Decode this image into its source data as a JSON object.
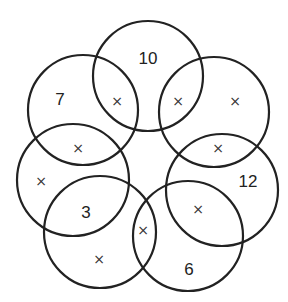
{
  "diagram": {
    "type": "ring-of-overlapping-circles",
    "stroke_color": "#222222",
    "background": "#ffffff",
    "circles": [
      {
        "id": "top",
        "cx": 148,
        "cy": 76,
        "r": 55
      },
      {
        "id": "top-left",
        "cx": 83,
        "cy": 110,
        "r": 55
      },
      {
        "id": "top-right",
        "cx": 214,
        "cy": 112,
        "r": 55
      },
      {
        "id": "left",
        "cx": 73,
        "cy": 180,
        "r": 56
      },
      {
        "id": "right",
        "cx": 222,
        "cy": 190,
        "r": 56
      },
      {
        "id": "bottom-left",
        "cx": 100,
        "cy": 232,
        "r": 56
      },
      {
        "id": "bottom-right",
        "cx": 188,
        "cy": 236,
        "r": 55
      }
    ],
    "numbers": [
      {
        "text": "10",
        "x": 148,
        "y": 60
      },
      {
        "text": "7",
        "x": 60,
        "y": 101
      },
      {
        "text": "12",
        "x": 248,
        "y": 183
      },
      {
        "text": "3",
        "x": 86,
        "y": 214
      },
      {
        "text": "6",
        "x": 189,
        "y": 271
      }
    ],
    "marks": [
      {
        "text": "×",
        "x": 117,
        "y": 102
      },
      {
        "text": "×",
        "x": 178,
        "y": 102
      },
      {
        "text": "×",
        "x": 235,
        "y": 102
      },
      {
        "text": "×",
        "x": 78,
        "y": 149
      },
      {
        "text": "×",
        "x": 218,
        "y": 149
      },
      {
        "text": "×",
        "x": 41,
        "y": 182
      },
      {
        "text": "×",
        "x": 198,
        "y": 210
      },
      {
        "text": "×",
        "x": 143,
        "y": 231
      },
      {
        "text": "×",
        "x": 99,
        "y": 260
      }
    ]
  }
}
